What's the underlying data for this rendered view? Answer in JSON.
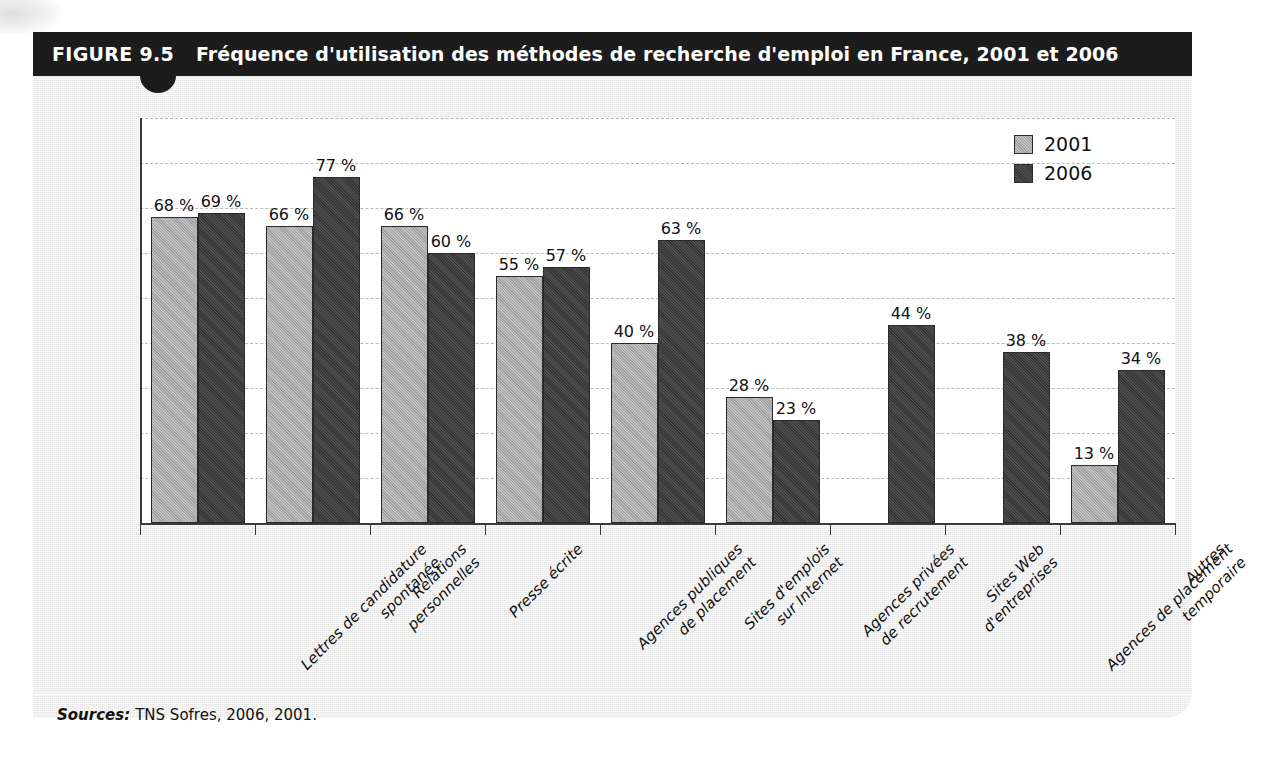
{
  "figure": {
    "number": "FIGURE 9.5",
    "title": "Fréquence d'utilisation des méthodes de recherche d'emploi en France, 2001 et 2006",
    "source_label": "Sources:",
    "source_text": "TNS Sofres, 2006, 2001."
  },
  "legend": {
    "items": [
      {
        "label": "2001",
        "color": "#a9a9a9"
      },
      {
        "label": "2006",
        "color": "#3b3b3b"
      }
    ]
  },
  "colors": {
    "header_bar": "#1c1c1c",
    "panel": "#eeeeee",
    "plot_background": "#ffffff",
    "series_2001": "#a9a9a9",
    "series_2006": "#3b3b3b",
    "gridline": "#b9b9b9",
    "axis": "#3a3a3a"
  },
  "chart_data": {
    "type": "bar",
    "title": "Fréquence d'utilisation des méthodes de recherche d'emploi en France, 2001 et 2006",
    "xlabel": "",
    "ylabel": "",
    "ylim": [
      0,
      90
    ],
    "grid": true,
    "legend_position": "top-right",
    "value_suffix": " %",
    "categories": [
      "Lettres de candidature spontanée",
      "Relations personnelles",
      "Presse écrite",
      "Agences publiques de placement",
      "Sites d'emplois sur Internet",
      "Agences privées de recrutement",
      "Sites Web d'entreprises",
      "Agences de placement temporaire",
      "Autres"
    ],
    "category_lines": [
      [
        "Lettres de candidature",
        "spontanée"
      ],
      [
        "Relations",
        "personnelles"
      ],
      [
        "Presse écrite"
      ],
      [
        "Agences publiques",
        "de placement"
      ],
      [
        "Sites d'emplois",
        "sur Internet"
      ],
      [
        "Agences privées",
        "de recrutement"
      ],
      [
        "Sites Web",
        "d'entreprises"
      ],
      [
        "Agences de placement",
        "temporaire"
      ],
      [
        "Autres"
      ]
    ],
    "series": [
      {
        "name": "2001",
        "values": [
          68,
          66,
          66,
          55,
          40,
          28,
          null,
          null,
          13
        ],
        "labels": [
          "68 %",
          "66 %",
          "66 %",
          "55 %",
          "40 %",
          "28 %",
          "",
          "",
          "13 %"
        ]
      },
      {
        "name": "2006",
        "values": [
          69,
          77,
          60,
          57,
          63,
          23,
          44,
          38,
          34
        ],
        "labels": [
          "69 %",
          "77 %",
          "60 %",
          "57 %",
          "63 %",
          "23 %",
          "44 %",
          "38 %",
          "34 %"
        ]
      }
    ]
  }
}
